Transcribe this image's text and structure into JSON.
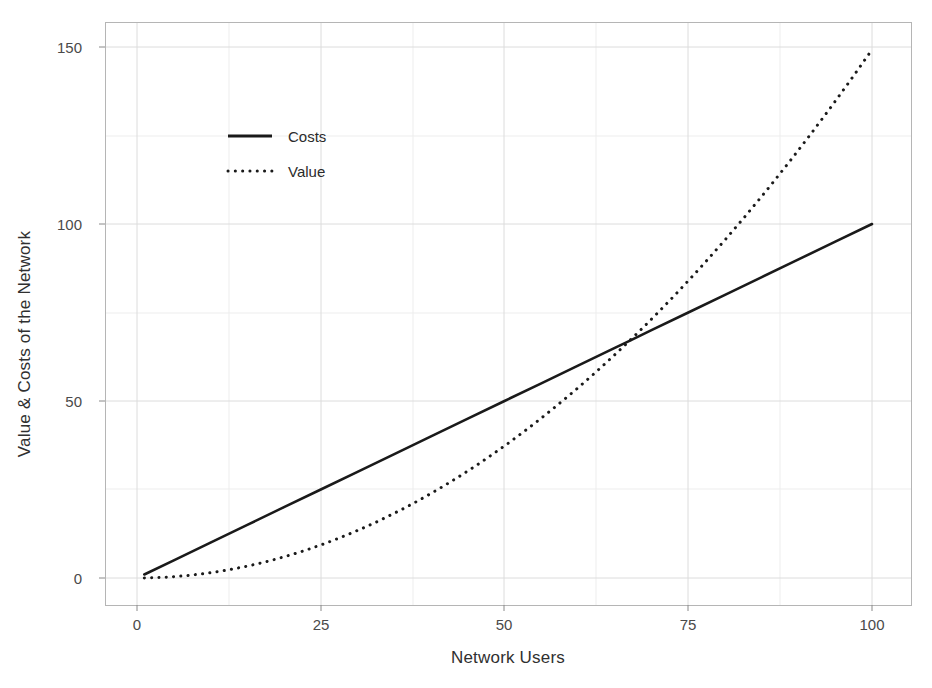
{
  "chart_data": {
    "type": "line",
    "title": "",
    "xlabel": "Network Users",
    "ylabel": "Value & Costs of the Network",
    "xlim": [
      0,
      103
    ],
    "ylim": [
      -3,
      157
    ],
    "xticks": [
      0,
      25,
      50,
      75,
      100
    ],
    "xtick_labels": [
      "0",
      "25",
      "50",
      "75",
      "100"
    ],
    "yticks": [
      0,
      50,
      100,
      150
    ],
    "ytick_labels": [
      "0",
      "50",
      "100",
      "150"
    ],
    "grid": true,
    "grid_minor": true,
    "legend_position": "upper-left-inside",
    "background_color": "#ffffff",
    "grid_color": "#e3e3e3",
    "panel_border_color": "#b9b9b9",
    "line_color": "#1a1a1a",
    "crossover_point": {
      "x": 67,
      "y": 67
    },
    "series": [
      {
        "name": "Costs",
        "style": "solid",
        "color": "#1a1a1a",
        "formula": "y = x",
        "x": [
          1,
          5,
          10,
          15,
          20,
          25,
          30,
          35,
          40,
          45,
          50,
          55,
          60,
          65,
          67,
          70,
          75,
          80,
          85,
          90,
          95,
          100
        ],
        "values": [
          1,
          5,
          10,
          15,
          20,
          25,
          30,
          35,
          40,
          45,
          50,
          55,
          60,
          65,
          67,
          70,
          75,
          80,
          85,
          90,
          95,
          100
        ]
      },
      {
        "name": "Value",
        "style": "dotted",
        "color": "#1a1a1a",
        "formula": "y = x^2 / 67",
        "x": [
          1,
          5,
          10,
          15,
          20,
          25,
          30,
          35,
          40,
          45,
          50,
          55,
          60,
          65,
          67,
          70,
          75,
          80,
          85,
          90,
          95,
          100
        ],
        "values": [
          0.01,
          0.37,
          1.49,
          3.36,
          5.97,
          9.33,
          13.43,
          18.28,
          23.88,
          30.22,
          37.31,
          45.15,
          53.73,
          63.06,
          67,
          73.13,
          83.96,
          95.52,
          107.84,
          120.9,
          134.7,
          149.25
        ]
      }
    ]
  },
  "legend": {
    "entries": [
      {
        "label": "Costs",
        "style": "solid"
      },
      {
        "label": "Value",
        "style": "dotted"
      }
    ]
  }
}
